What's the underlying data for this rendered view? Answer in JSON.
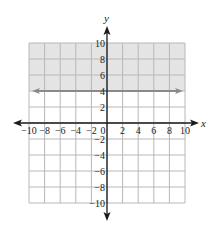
{
  "chart_data": {
    "type": "line",
    "title": "",
    "xlabel": "x",
    "ylabel": "y",
    "xlim": [
      -10,
      10
    ],
    "ylim": [
      -10,
      10
    ],
    "grid": true,
    "grid_step": 2,
    "x_ticks": [
      "-10",
      "-8",
      "-6",
      "-4",
      "-2",
      "0",
      "2",
      "4",
      "6",
      "8",
      "10"
    ],
    "y_ticks": [
      "10",
      "8",
      "6",
      "4",
      "2",
      "-2",
      "-4",
      "-6",
      "-8",
      "-10"
    ],
    "series": [
      {
        "name": "y = 4",
        "type": "horizontal-line",
        "y": 4,
        "x": [
          -10,
          10
        ],
        "style": "solid",
        "arrows": "both"
      }
    ],
    "shaded_region": {
      "condition": "y >= 4",
      "y_from": 4,
      "y_to": 10
    },
    "colors": {
      "shade": "#e4e4e4",
      "grid": "#b8b8b8",
      "boundary_line": "#8a8a8a",
      "axes": "#1a1a1a"
    }
  }
}
